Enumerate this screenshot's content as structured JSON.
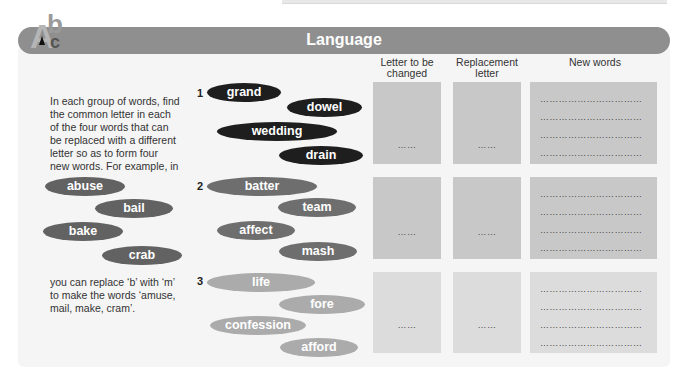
{
  "header": {
    "title": "Language",
    "logo": {
      "letters": [
        "A",
        "b",
        "c"
      ],
      "icon": "abc-logo-icon"
    }
  },
  "instructions": {
    "intro": "In each group of words, find the common letter in each of the four words that can be replaced with a different letter so as to form four new words. For example, in",
    "example_words": [
      "abuse",
      "bail",
      "bake",
      "crab"
    ],
    "outro": "you can replace ‘b’ with ‘m’ to make the words ‘amuse, mail, make, cram’."
  },
  "columns": {
    "letter_to_change": "Letter to be changed",
    "replacement": "Replacement letter",
    "new_words": "New words"
  },
  "groups": [
    {
      "number": "1",
      "words": [
        "grand",
        "dowel",
        "wedding",
        "drain"
      ],
      "color": "#1e1e1e"
    },
    {
      "number": "2",
      "words": [
        "batter",
        "team",
        "affect",
        "mash"
      ],
      "color": "#6e6e6e"
    },
    {
      "number": "3",
      "words": [
        "life",
        "fore",
        "confession",
        "afford"
      ],
      "color": "#ababab"
    }
  ],
  "answers": {
    "short_blank": "……",
    "long_blank": "……………………………"
  },
  "colors": {
    "banner": "#8f8f8f",
    "panel": "#f5f5f5",
    "box_dark": "#c8c8c8",
    "box_light": "#dcdcdc"
  }
}
